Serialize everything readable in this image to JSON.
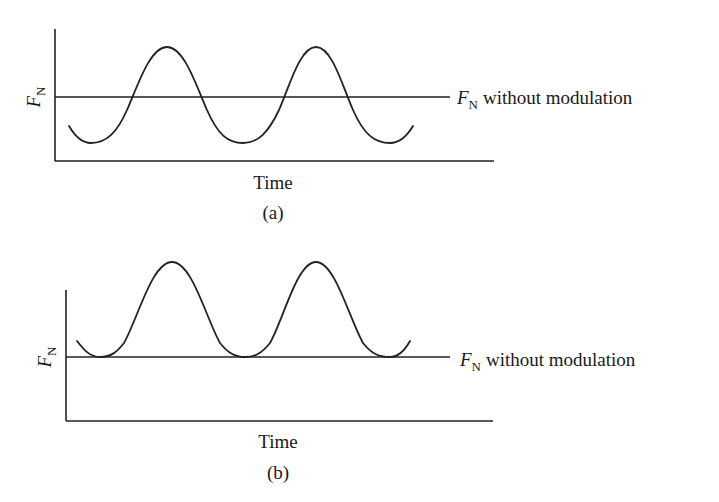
{
  "panels": [
    {
      "id": "a",
      "y_axis_label": "F",
      "y_axis_label_sub": "N",
      "x_axis_label": "Time",
      "caption": "(a)",
      "reference_label": "F",
      "reference_label_sub": "N",
      "reference_text": "without modulation",
      "description": "F_N oscillates sinusoidally around its unmodulated value"
    },
    {
      "id": "b",
      "y_axis_label": "F",
      "y_axis_label_sub": "N",
      "x_axis_label": "Time",
      "caption": "(b)",
      "reference_label": "F",
      "reference_label_sub": "N",
      "reference_text": "without modulation",
      "description": "F_N oscillates above its unmodulated value; troughs just touch it"
    }
  ],
  "colors": {
    "line": "#222222",
    "text": "#1a1a1a",
    "background": "#ffffff"
  }
}
